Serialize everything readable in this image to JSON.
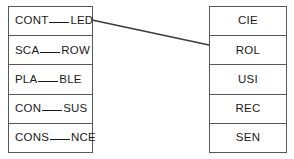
{
  "exercise": {
    "type": "matching",
    "left_column": {
      "name": "terms-with-blanks",
      "items": [
        {
          "prefix": "CONT",
          "suffix": "LED",
          "blank": true,
          "full_text": "CONT____LED"
        },
        {
          "prefix": "SCA",
          "suffix": "ROW",
          "blank": true,
          "full_text": "SCA____ROW"
        },
        {
          "prefix": "PLA",
          "suffix": "BLE",
          "blank": true,
          "full_text": "PLA____BLE"
        },
        {
          "prefix": "CON",
          "suffix": "SUS",
          "blank": true,
          "full_text": "CON____SUS"
        },
        {
          "prefix": "CONS",
          "suffix": "NCE",
          "blank": true,
          "full_text": "CONS____NCE"
        }
      ]
    },
    "right_column": {
      "name": "answer-fragments",
      "items": [
        {
          "label": "CIE"
        },
        {
          "label": "ROL"
        },
        {
          "label": "USI"
        },
        {
          "label": "REC"
        },
        {
          "label": "SEN"
        }
      ]
    },
    "connections": [
      {
        "from_left_index": 0,
        "to_right_index": 1,
        "x1": 92,
        "y1": 20,
        "x2": 209,
        "y2": 45
      }
    ],
    "colors": {
      "border": "#585858",
      "text": "#1a1a1a",
      "background": "#ffffff",
      "connector": "#3a3a3a"
    }
  }
}
